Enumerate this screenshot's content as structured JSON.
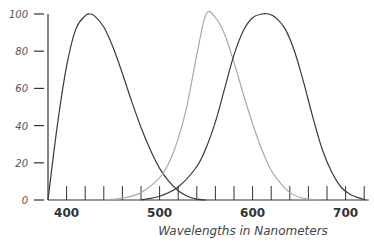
{
  "chart_data": {
    "type": "line",
    "title": "",
    "xlabel": "Wavelengths in Nanometers",
    "ylabel": "",
    "xlim": [
      380,
      725
    ],
    "ylim": [
      0,
      100
    ],
    "grid": false,
    "legend": null,
    "x_ticks": [
      400,
      500,
      600,
      700
    ],
    "x_minor_tick_step": 20,
    "y_ticks": [
      0,
      20,
      40,
      60,
      80,
      100
    ],
    "y_tick_labels": [
      "0",
      "20",
      "40",
      "60",
      "80",
      "100"
    ],
    "series": [
      {
        "name": "short-wavelength curve",
        "color": "#3a3a3a",
        "x": [
          380,
          390,
          400,
          410,
          420,
          425,
          430,
          440,
          450,
          460,
          470,
          480,
          490,
          500,
          510,
          520,
          530,
          540,
          550
        ],
        "y": [
          0,
          40,
          72,
          92,
          99,
          100,
          99,
          93,
          82,
          68,
          53,
          39,
          27,
          17,
          10,
          5,
          2,
          0.5,
          0
        ]
      },
      {
        "name": "medium-wavelength curve",
        "color": "#aaaaaa",
        "x": [
          440,
          460,
          480,
          500,
          510,
          520,
          530,
          540,
          550,
          560,
          570,
          580,
          590,
          600,
          610,
          620,
          630,
          640,
          650,
          660,
          670
        ],
        "y": [
          0,
          1,
          4,
          12,
          20,
          33,
          52,
          78,
          100,
          98,
          89,
          74,
          57,
          41,
          27,
          16,
          9,
          4,
          1.5,
          0.5,
          0
        ]
      },
      {
        "name": "long-wavelength curve",
        "color": "#3a3a3a",
        "x": [
          480,
          500,
          520,
          540,
          550,
          560,
          570,
          580,
          590,
          600,
          610,
          617,
          625,
          635,
          645,
          655,
          665,
          675,
          685,
          695,
          705,
          715,
          722
        ],
        "y": [
          0,
          2,
          7,
          18,
          28,
          42,
          60,
          78,
          91,
          98,
          100,
          100,
          98,
          92,
          80,
          63,
          44,
          27,
          15,
          7,
          3,
          1,
          0
        ]
      }
    ]
  }
}
